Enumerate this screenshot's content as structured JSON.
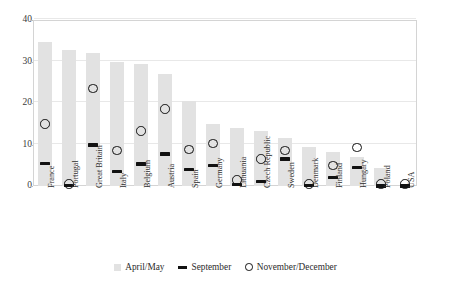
{
  "chart_data": {
    "type": "bar",
    "title": "",
    "subtitle": "",
    "xlabel": "",
    "ylabel": "",
    "ylim": [
      0,
      40
    ],
    "yticks": [
      0,
      10,
      20,
      30,
      40
    ],
    "ytick_labels": [
      "0",
      "10",
      "20",
      "30",
      "40"
    ],
    "grid": true,
    "legend_position": "bottom",
    "categories": [
      "France",
      "Portugal",
      "Great Britain",
      "Italy",
      "Belgium",
      "Austria",
      "Spain",
      "Germany",
      "Lithuania",
      "Czech Republic",
      "Sweden",
      "Denmark",
      "Finland",
      "Hungary",
      "Poland",
      "USA"
    ],
    "series": [
      {
        "name": "April/May",
        "marker": "bar",
        "color": "#e2e2e2",
        "values": [
          34.7,
          32.7,
          32.0,
          30.0,
          29.5,
          27.0,
          20.5,
          15.0,
          14.0,
          13.3,
          11.5,
          9.5,
          8.3,
          7.0,
          4.3,
          0.0
        ]
      },
      {
        "name": "September",
        "marker": "dash",
        "color": "#121212",
        "values": [
          5.5,
          0.2,
          9.9,
          3.5,
          5.3,
          7.7,
          4.0,
          5.0,
          0.3,
          1.0,
          6.5,
          0.2,
          2.0,
          4.5,
          0.0,
          0.0
        ]
      },
      {
        "name": "November/December",
        "marker": "circle",
        "color": "#111111",
        "values": [
          15.0,
          0.5,
          23.5,
          8.5,
          13.3,
          18.5,
          8.8,
          10.3,
          1.5,
          6.5,
          8.5,
          0.5,
          5.0,
          9.3,
          0.5,
          0.5
        ]
      }
    ]
  },
  "legend": {
    "items": [
      {
        "label": "April/May",
        "swatch": "bar-swatch-icon"
      },
      {
        "label": "September",
        "swatch": "dash-swatch-icon"
      },
      {
        "label": "November/December",
        "swatch": "circle-swatch-icon"
      }
    ]
  }
}
